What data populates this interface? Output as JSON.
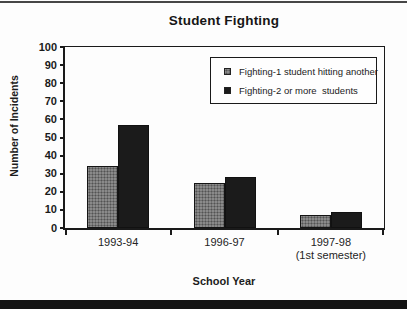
{
  "page": {
    "top_rule_color": "#474747",
    "bottom_band_color": "#141414",
    "background": "#fdfdfd"
  },
  "chart_data": {
    "type": "bar",
    "title": "Student Fighting",
    "xlabel": "School Year",
    "ylabel": "Number of Incidents",
    "ylim": [
      0,
      100
    ],
    "yticks": [
      0,
      10,
      20,
      30,
      40,
      50,
      60,
      70,
      80,
      90,
      100
    ],
    "grid": false,
    "legend_position": "upper-right-inside",
    "categories": [
      "1993-94",
      "1996-97",
      "1997-98"
    ],
    "category_sublabels": [
      "",
      "",
      "(1st semester)"
    ],
    "series": [
      {
        "name": "Fighting-1 student hitting another",
        "values": [
          34,
          25,
          7
        ],
        "color": "#8a8a8a",
        "style": "halftone-gray"
      },
      {
        "name": "Fighting-2 or more  students",
        "values": [
          57,
          28,
          9
        ],
        "color": "#1b1b1b",
        "style": "solid-black"
      }
    ],
    "bar_width_px": 31
  }
}
